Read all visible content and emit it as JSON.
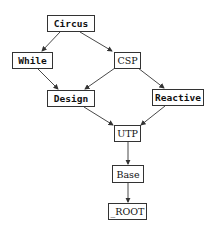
{
  "diagram": {
    "type": "directed-graph",
    "nodes": [
      {
        "id": "circus",
        "label": "Circus"
      },
      {
        "id": "while",
        "label": "While"
      },
      {
        "id": "csp",
        "label": "CSP"
      },
      {
        "id": "design",
        "label": "Design"
      },
      {
        "id": "reactive",
        "label": "Reactive"
      },
      {
        "id": "utp",
        "label": "UTP"
      },
      {
        "id": "base",
        "label": "Base"
      },
      {
        "id": "root",
        "label": "_ROOT"
      }
    ],
    "edges": [
      {
        "from": "Circus",
        "to": "While"
      },
      {
        "from": "Circus",
        "to": "CSP"
      },
      {
        "from": "While",
        "to": "Design"
      },
      {
        "from": "CSP",
        "to": "Design"
      },
      {
        "from": "CSP",
        "to": "Reactive"
      },
      {
        "from": "Design",
        "to": "UTP"
      },
      {
        "from": "Reactive",
        "to": "UTP"
      },
      {
        "from": "UTP",
        "to": "Base"
      },
      {
        "from": "Base",
        "to": "_ROOT"
      }
    ],
    "colors": {
      "edge": "#333333",
      "node_border": "#333333",
      "background": "#ffffff"
    }
  }
}
